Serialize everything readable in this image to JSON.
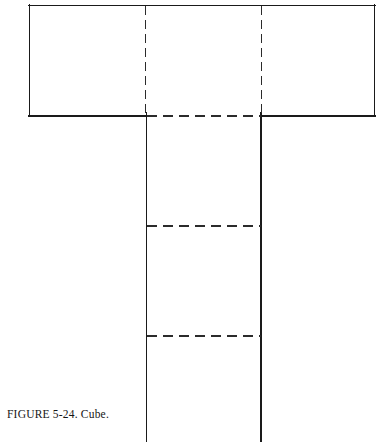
{
  "figure": {
    "caption": "FIGURE 5-24.  Cube.",
    "caption_label": "FIGURE 5-24.",
    "caption_title": "Cube.",
    "background_color": "#ffffff",
    "stroke_color": "#1a1a1a",
    "fold_line_color": "#2b2b2b",
    "solid_stroke_width": 1.6,
    "dashed_stroke_width": 1.4,
    "dash_pattern_horizontal": "10 6",
    "dash_pattern_vertical": "9 5"
  },
  "diagram_data": {
    "type": "net-unfolding",
    "subject": "Cube",
    "description": "Unfolded planar net of a cube drawn as a cross/T shape: a wide horizontal band of three square faces across the top and a vertical column of faces descending from the center, with dashed lines marking the fold edges.",
    "canvas": {
      "width": 381,
      "height": 442
    },
    "top_band": {
      "name": "horizontal-band",
      "x": 29,
      "y": 5,
      "width": 346,
      "height": 111,
      "faces": 3,
      "outline": "solid"
    },
    "vertical_stem": {
      "name": "vertical-column",
      "x": 146,
      "y": 116,
      "width": 115,
      "height": 326,
      "outline": "solid-sides-open-bottom",
      "cropped_at_page_edge": true
    },
    "fold_lines": [
      {
        "id": "fold-v-left",
        "orientation": "vertical",
        "x": 145,
        "y1": 5,
        "y2": 116,
        "style": "dashed"
      },
      {
        "id": "fold-v-right",
        "orientation": "vertical",
        "x": 261,
        "y1": 5,
        "y2": 116,
        "style": "dashed"
      },
      {
        "id": "fold-h-top",
        "orientation": "horizontal",
        "y": 116,
        "x1": 146,
        "x2": 261,
        "style": "dashed"
      },
      {
        "id": "fold-h-middle",
        "orientation": "horizontal",
        "y": 226,
        "x1": 146,
        "x2": 261,
        "style": "dashed"
      },
      {
        "id": "fold-h-lower",
        "orientation": "horizontal",
        "y": 336,
        "x1": 146,
        "x2": 261,
        "style": "dashed"
      }
    ],
    "solid_edges": [
      {
        "id": "edge-band-top",
        "x1": 29,
        "y1": 5,
        "x2": 375,
        "y2": 5
      },
      {
        "id": "edge-band-left",
        "x1": 29,
        "y1": 5,
        "x2": 29,
        "y2": 116
      },
      {
        "id": "edge-band-right",
        "x1": 375,
        "y1": 5,
        "x2": 375,
        "y2": 116
      },
      {
        "id": "edge-band-bottom-left",
        "x1": 29,
        "y1": 116,
        "x2": 146,
        "y2": 116
      },
      {
        "id": "edge-band-bottom-right",
        "x1": 261,
        "y1": 116,
        "x2": 375,
        "y2": 116
      },
      {
        "id": "edge-stem-left",
        "x1": 146,
        "y1": 116,
        "x2": 146,
        "y2": 442
      },
      {
        "id": "edge-stem-right",
        "x1": 261,
        "y1": 116,
        "x2": 261,
        "y2": 442
      }
    ]
  }
}
